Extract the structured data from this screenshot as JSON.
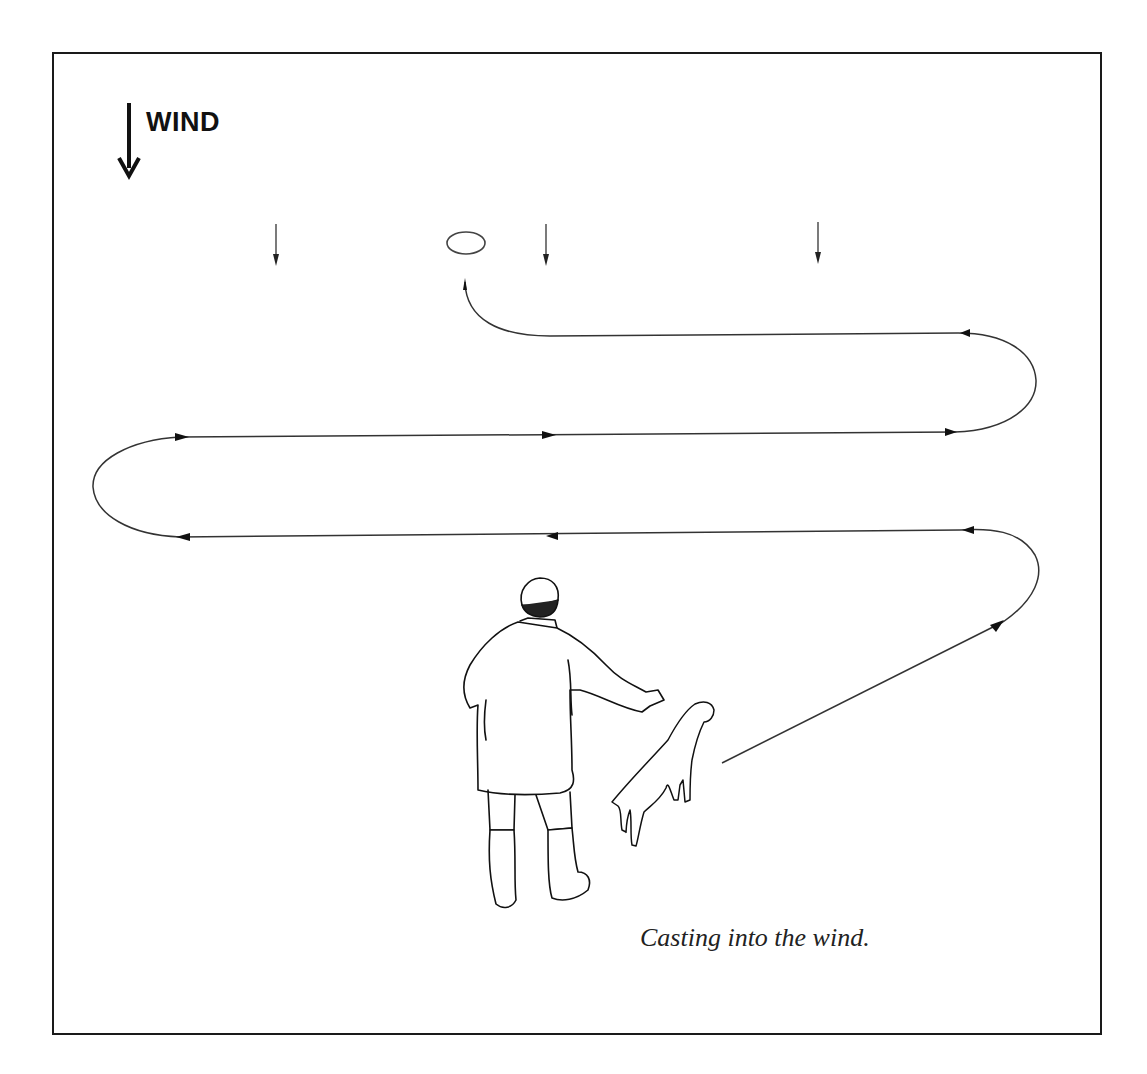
{
  "figure": {
    "wind_label": "WIND",
    "caption": "Casting into the wind.",
    "colors": {
      "line": "#333333",
      "frame": "#1a1a1a",
      "background": "#ffffff"
    },
    "elements": {
      "wind_indicator": "large down arrow (wind direction)",
      "small_wind_arrows": 3,
      "target_marker": "ellipse (object/bird location)",
      "path": "zig-zag casting path with directional arrowheads",
      "figures": [
        "handler (man in coat and boots, seen from behind)",
        "dog"
      ]
    }
  }
}
